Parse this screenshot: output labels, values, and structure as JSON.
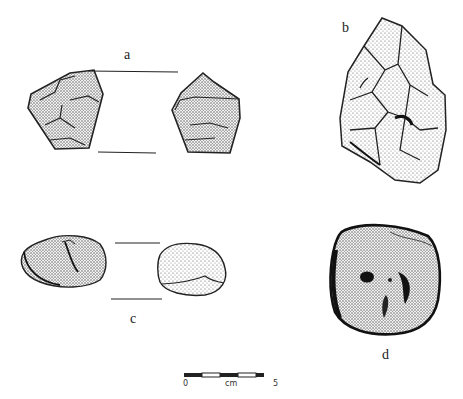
{
  "figure": {
    "artifacts": [
      {
        "id": "a",
        "label": "a",
        "description": "polyhedral core, two views"
      },
      {
        "id": "b",
        "label": "b",
        "description": "bifacial handaxe"
      },
      {
        "id": "c",
        "label": "c",
        "description": "pebble, two views"
      },
      {
        "id": "d",
        "label": "d",
        "description": "pitted stone / anvil"
      }
    ],
    "scale_bar": {
      "start_label": "0",
      "unit_label": "cm",
      "end_label": "5"
    },
    "colors": {
      "ink": "#222222",
      "stipple": "#555555",
      "background": "#ffffff"
    }
  }
}
